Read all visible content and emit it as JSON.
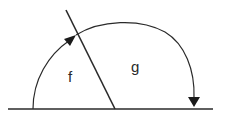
{
  "diagram": {
    "labels": {
      "angle_left": "f",
      "angle_right": "g"
    },
    "colors": {
      "stroke": "#2a2a2a",
      "background": "#ffffff"
    }
  }
}
